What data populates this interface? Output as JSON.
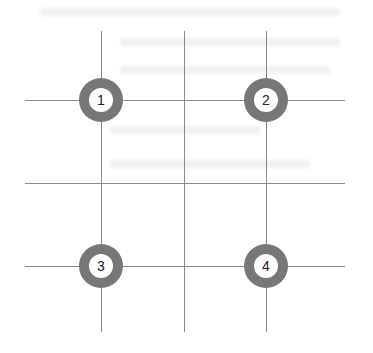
{
  "diagram": {
    "type": "grid-with-numbered-markers",
    "grid": {
      "vertical_lines_x": [
        101,
        184,
        266
      ],
      "vertical_span_y": [
        31,
        332
      ],
      "horizontal_lines_y": [
        100,
        183,
        266
      ],
      "horizontal_span_x": [
        25,
        345
      ],
      "line_color": "#8a8a8a"
    },
    "markers": [
      {
        "label": "1",
        "cx": 101,
        "cy": 100
      },
      {
        "label": "2",
        "cx": 266,
        "cy": 100
      },
      {
        "label": "3",
        "cx": 101,
        "cy": 266
      },
      {
        "label": "4",
        "cx": 266,
        "cy": 266
      }
    ],
    "marker_ring_color": "#777777"
  }
}
